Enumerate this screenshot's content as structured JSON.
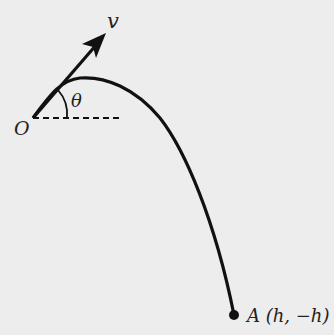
{
  "diagram": {
    "type": "projectile-trajectory",
    "labels": {
      "origin": "O",
      "velocity": "v",
      "angle": "θ",
      "point": "A (h, −h)"
    },
    "colors": {
      "background": "#ededed",
      "ink": "#111111"
    }
  }
}
